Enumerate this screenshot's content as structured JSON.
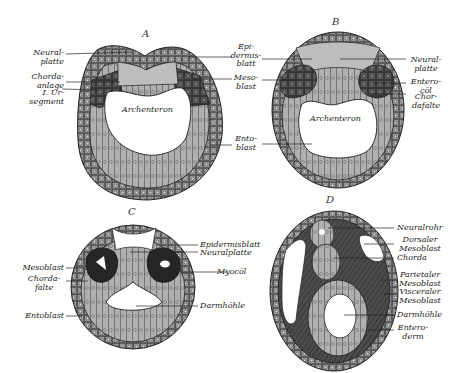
{
  "figure": {
    "colors": {
      "ectoderm": "#8a8a8a",
      "neural": "#b4b4b4",
      "mesoblast": "#4a4a4a",
      "entoblast": "#a9a9a9",
      "cavity": "#ffffff",
      "outline": "#1e1e1e"
    },
    "panels": [
      {
        "letter": "A",
        "labels": {
          "neuralplatte": "Neural-\nplatte",
          "chordaanlage": "Chorda-\nanlage",
          "ursegment": "I. Ur-\nsegment",
          "archenteron": "Archenteron"
        }
      },
      {
        "letter": "B",
        "labels": {
          "epidermisblatt": "Epi-\ndermis-\nblatt",
          "mesoblast": "Meso-\nblast",
          "entoblast": "Ento-\nblast",
          "neuralplatte": "Neural-\nplatte",
          "enterocoel": "Entero-\ncöl",
          "chordafalte": "Chor-\ndafalte",
          "archenteron": "Archenteron"
        }
      },
      {
        "letter": "C",
        "labels": {
          "mesoblast": "Mesoblast",
          "chordafalte": "Chorda-\nfalte",
          "entoblast": "Entoblast",
          "epidermisblatt": "Epidermisblatt",
          "neuralplatte": "Neuralplatte",
          "myocoel": "Myocöl",
          "darmhoehle": "Darmhöhle"
        }
      },
      {
        "letter": "D",
        "labels": {
          "neuralrohr": "Neuralrohr",
          "dorsaler_mesoblast": "Dorsaler\nMesoblast",
          "chorda": "Chorda",
          "parietaler_mesoblast": "Parietaler\nMesoblast",
          "visceraler_mesoblast": "Visceraler\nMesoblast",
          "darmhoehle": "Darmhöhle",
          "enteroderm": "Entero-\nderm"
        }
      }
    ]
  }
}
